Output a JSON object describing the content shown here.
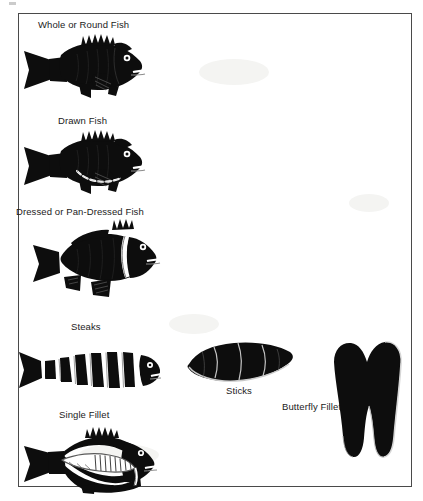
{
  "figure": {
    "border_color": "#4a4a4a",
    "ink_color": "#0d0d0d",
    "background_color": "#ffffff",
    "items": [
      {
        "id": "whole-round-fish",
        "label": "Whole or Round Fish",
        "label_x": 37,
        "label_y": 18,
        "art_x": 20,
        "art_y": 31,
        "art_w": 120,
        "art_h": 64
      },
      {
        "id": "drawn-fish",
        "label": "Drawn Fish",
        "label_x": 57,
        "label_y": 114,
        "art_x": 20,
        "art_y": 127,
        "art_w": 120,
        "art_h": 64
      },
      {
        "id": "dressed-pan-dressed-fish",
        "label": "Dressed or Pan-Dressed Fish",
        "label_x": 15,
        "label_y": 205,
        "art_x": 14,
        "art_y": 219,
        "art_w": 135,
        "art_h": 72
      },
      {
        "id": "steaks",
        "label": "Steaks",
        "label_x": 70,
        "label_y": 320,
        "art_x": 14,
        "art_y": 334,
        "art_w": 135,
        "art_h": 58
      },
      {
        "id": "sticks",
        "label": "Sticks",
        "label_x": 225,
        "label_y": 384,
        "art_x": 182,
        "art_y": 338,
        "art_w": 110,
        "art_h": 45
      },
      {
        "id": "butterfly-fillet",
        "label": "Butterfly Fillet",
        "label_x": 281,
        "label_y": 400,
        "art_x": 325,
        "art_y": 339,
        "art_w": 78,
        "art_h": 118
      },
      {
        "id": "single-fillet",
        "label": "Single Fillet",
        "label_x": 58,
        "label_y": 408,
        "art_x": 20,
        "art_y": 424,
        "art_w": 130,
        "art_h": 62
      }
    ]
  }
}
